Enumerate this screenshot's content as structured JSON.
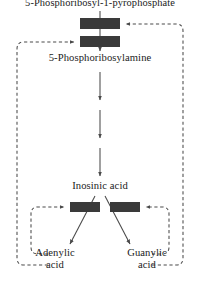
{
  "diagram": {
    "type": "biochemical-pathway-feedback-inhibition",
    "nodes": {
      "prpp": "5-Phosphoribosyl-1-pyrophosphate",
      "phosphoribosylamine": "5-Phosphoribosylamine",
      "inosinic_acid": "Inosinic acid",
      "adenylic_acid_line1": "Adenylic",
      "adenylic_acid_line2": "acid",
      "guanylic_acid_line1": "Guanylic",
      "guanylic_acid_line2": "acid"
    },
    "colors": {
      "stroke": "#4a4a4a",
      "text": "#1a1a1a",
      "inhibition_bar": "#3a3a3a",
      "background": "#ffffff"
    },
    "inhibition_bars": [
      {
        "name": "inhibition-bar-prpp-upper",
        "x": 80,
        "y": 18,
        "width": 40,
        "height": 11
      },
      {
        "name": "inhibition-bar-prpp-lower",
        "x": 80,
        "y": 36,
        "width": 40,
        "height": 11
      },
      {
        "name": "inhibition-bar-adenylic",
        "x": 70,
        "y": 202,
        "width": 30,
        "height": 10
      },
      {
        "name": "inhibition-bar-guanylic",
        "x": 110,
        "y": 202,
        "width": 30,
        "height": 10
      }
    ],
    "arrow_count_main_chain": 4,
    "feedback_loops": [
      "adenylic-acid-to-prpp-lower-bar",
      "guanylic-acid-to-prpp-upper-bar",
      "adenylic-acid-to-adenylic-branch-bar",
      "guanylic-acid-to-guanylic-branch-bar"
    ]
  }
}
